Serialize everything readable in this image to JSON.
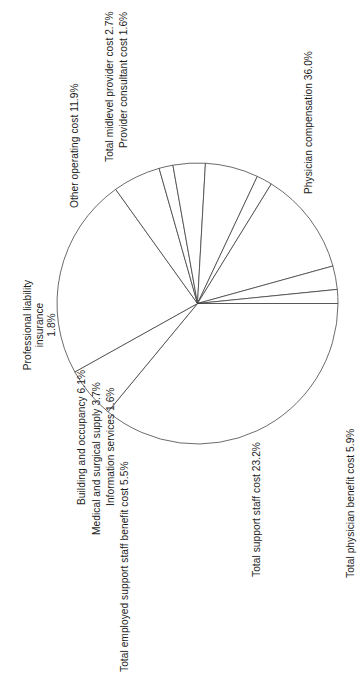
{
  "chart_data": {
    "type": "pie",
    "title": "",
    "subtitle": "",
    "xlabel": "",
    "ylabel": "",
    "legend_position": "none",
    "grid": false,
    "orientation": "rotated-90",
    "value_unit": "%",
    "total": "100.0%",
    "categories": [
      "Physician compensation",
      "Total physician benefit cost",
      "Total support staff cost",
      "Total employed support staff benefit cost",
      "Information services",
      "Medical and surgical supply",
      "Building and occupancy",
      "Professional liability insurance",
      "Other operating cost",
      "Total midlevel provider cost",
      "Provider consultant cost"
    ],
    "values": [
      36.0,
      5.9,
      23.2,
      5.5,
      1.6,
      3.7,
      6.1,
      1.8,
      11.9,
      2.7,
      1.6
    ],
    "slices": [
      {
        "name": "physician-compensation",
        "label": "Physician compensation 36.0%",
        "category": "Physician compensation",
        "value": 36.0,
        "value_text": "36.0%",
        "color": "#ffffff",
        "stroke": "#3a3a3a"
      },
      {
        "name": "total-physician-benefit-cost",
        "label": "Total physician benefit cost 5.9%",
        "category": "Total physician benefit cost",
        "value": 5.9,
        "value_text": "5.9%",
        "color": "#ffffff",
        "stroke": "#3a3a3a"
      },
      {
        "name": "total-support-staff-cost",
        "label": "Total support staff cost 23.2%",
        "category": "Total support staff cost",
        "value": 23.2,
        "value_text": "23.2%",
        "color": "#ffffff",
        "stroke": "#3a3a3a"
      },
      {
        "name": "total-employed-support-staff-benefit-cost",
        "label": "Total employed support staff benefit cost 5.5%",
        "category": "Total employed support staff benefit cost",
        "value": 5.5,
        "value_text": "5.5%",
        "color": "#ffffff",
        "stroke": "#3a3a3a"
      },
      {
        "name": "information-services",
        "label": "Information services 1.6%",
        "category": "Information services",
        "value": 1.6,
        "value_text": "1.6%",
        "color": "#ffffff",
        "stroke": "#3a3a3a"
      },
      {
        "name": "medical-and-surgical-supply",
        "label": "Medical and surgical supply 3.7%",
        "category": "Medical and surgical supply",
        "value": 3.7,
        "value_text": "3.7%",
        "color": "#ffffff",
        "stroke": "#3a3a3a"
      },
      {
        "name": "building-and-occupancy",
        "label": "Building and occupancy 6.1%",
        "category": "Building and occupancy",
        "value": 6.1,
        "value_text": "6.1%",
        "color": "#ffffff",
        "stroke": "#3a3a3a"
      },
      {
        "name": "professional-liability-insurance",
        "label": "Professional liability insurance 1.8%",
        "label_line1": "Professional liability",
        "label_line2": "insurance",
        "label_line3": "1.8%",
        "category": "Professional liability insurance",
        "value": 1.8,
        "value_text": "1.8%",
        "color": "#ffffff",
        "stroke": "#3a3a3a"
      },
      {
        "name": "other-operating-cost",
        "label": "Other operating cost 11.9%",
        "category": "Other operating cost",
        "value": 11.9,
        "value_text": "11.9%",
        "color": "#ffffff",
        "stroke": "#3a3a3a"
      },
      {
        "name": "total-midlevel-provider-cost",
        "label": "Total midlevel provider cost 2.7%",
        "category": "Total midlevel provider cost",
        "value": 2.7,
        "value_text": "2.7%",
        "color": "#ffffff",
        "stroke": "#3a3a3a"
      },
      {
        "name": "provider-consultant-cost",
        "label": "Provider consultant cost 1.6%",
        "category": "Provider consultant cost",
        "value": 1.6,
        "value_text": "1.6%",
        "color": "#ffffff",
        "stroke": "#3a3a3a"
      }
    ]
  }
}
